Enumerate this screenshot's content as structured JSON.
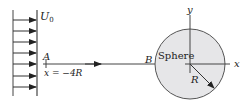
{
  "diagram": {
    "freestream_label": "U",
    "freestream_subscript": "0",
    "point_a_label": "A",
    "point_a_position": "x = −4R",
    "point_b_label": "B",
    "sphere_label": "Sphere",
    "radius_label": "R",
    "x_axis_label": "x",
    "y_axis_label": "y",
    "colors": {
      "stroke": "#333333",
      "sphere_fill": "#e6e6e8",
      "sphere_stroke": "#555555"
    },
    "inflow_arrow_count": 7
  }
}
